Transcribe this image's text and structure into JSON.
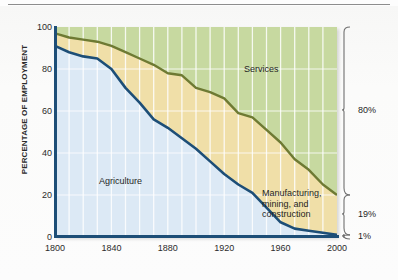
{
  "chart_data": {
    "type": "area",
    "title": "",
    "xlabel": "",
    "ylabel": "PERCENTAGE OF EMPLOYMENT",
    "xlim": [
      1800,
      2000
    ],
    "ylim": [
      0,
      100
    ],
    "xticks": [
      1800,
      1840,
      1880,
      1920,
      1960,
      2000
    ],
    "yticks": [
      0,
      20,
      40,
      60,
      80,
      100
    ],
    "grid": true,
    "gridline_interval_years": 10,
    "legend_position": "inline-area-labels",
    "stacked": true,
    "x": [
      1800,
      1810,
      1820,
      1830,
      1840,
      1850,
      1860,
      1870,
      1880,
      1890,
      1900,
      1910,
      1920,
      1930,
      1940,
      1950,
      1960,
      1970,
      1980,
      1990,
      2000
    ],
    "series": [
      {
        "name": "Agriculture",
        "color": "#dce9f5",
        "line_color": "#1d4e77",
        "values": [
          91,
          88,
          86,
          85,
          80,
          71,
          64,
          56,
          52,
          47,
          42,
          36,
          30,
          25,
          21,
          14,
          7,
          4,
          3,
          2,
          1
        ]
      },
      {
        "name": "Manufacturing, mining, and construction",
        "color": "#f0dfa8",
        "line_color": "#6e7a33",
        "values": [
          6,
          7,
          8,
          8,
          11,
          17,
          21,
          26,
          26,
          30,
          29,
          33,
          36,
          34,
          36,
          37,
          38,
          33,
          29,
          23,
          19
        ]
      },
      {
        "name": "Services",
        "color": "#c7d9a0",
        "line_color": "#6e7a33",
        "values": [
          3,
          5,
          6,
          7,
          9,
          12,
          15,
          18,
          22,
          23,
          29,
          31,
          34,
          41,
          43,
          49,
          55,
          63,
          68,
          75,
          80
        ]
      }
    ],
    "cumulative_agriculture": [
      91,
      88,
      86,
      85,
      80,
      71,
      64,
      56,
      52,
      47,
      42,
      36,
      30,
      25,
      21,
      14,
      7,
      4,
      3,
      2,
      1
    ],
    "cumulative_agri_plus_mfg": [
      97,
      95,
      94,
      93,
      91,
      88,
      85,
      82,
      78,
      77,
      71,
      69,
      66,
      59,
      57,
      51,
      45,
      37,
      32,
      25,
      20
    ],
    "annotations": [
      {
        "label": "80%",
        "value": 80,
        "bracket_span_pct": [
          20,
          100
        ],
        "series": "Services"
      },
      {
        "label": "19%",
        "value": 19,
        "bracket_span_pct": [
          1,
          20
        ],
        "series": "Manufacturing, mining, and construction"
      },
      {
        "label": "1%",
        "value": 1,
        "bracket_span_pct": [
          0,
          1
        ],
        "series": "Agriculture"
      }
    ],
    "area_labels": {
      "services": "Services",
      "agriculture": "Agriculture",
      "manufacturing": "Manufacturing, mining, and construction",
      "manufacturing_line1": "Manufacturing,",
      "manufacturing_line2": "mining, and",
      "manufacturing_line3": "construction"
    }
  },
  "colors": {
    "axis": "#1d4e77",
    "agriculture_fill": "#dce9f5",
    "agriculture_line": "#1d4e77",
    "manufacturing_fill": "#f0dfa8",
    "services_fill": "#c7d9a0",
    "services_line": "#6e7a33",
    "bracket": "#6f6f6f",
    "top_rule": "#8d8d8d"
  }
}
